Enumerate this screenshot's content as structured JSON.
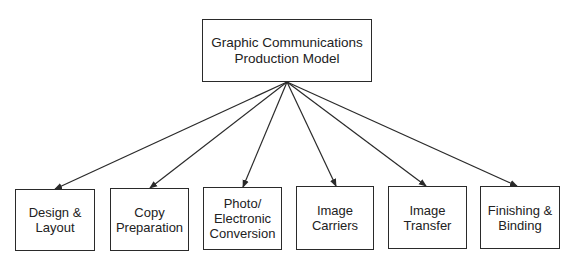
{
  "diagram": {
    "root": {
      "label": "Graphic Communications\nProduction Model",
      "box": {
        "x": 202,
        "y": 19,
        "w": 170,
        "h": 63
      }
    },
    "origin": {
      "x": 287,
      "y": 82
    },
    "children": [
      {
        "label": "Design &\nLayout",
        "box": {
          "x": 15,
          "y": 189,
          "w": 80,
          "h": 62
        },
        "arrow_end": {
          "x": 55,
          "y": 189
        }
      },
      {
        "label": "Copy\nPreparation",
        "box": {
          "x": 110,
          "y": 188,
          "w": 79,
          "h": 63
        },
        "arrow_end": {
          "x": 150,
          "y": 188
        }
      },
      {
        "label": "Photo/\nElectronic\nConversion",
        "box": {
          "x": 203,
          "y": 187,
          "w": 79,
          "h": 63
        },
        "arrow_end": {
          "x": 243,
          "y": 187
        }
      },
      {
        "label": "Image\nCarriers",
        "box": {
          "x": 296,
          "y": 186,
          "w": 78,
          "h": 64
        },
        "arrow_end": {
          "x": 336,
          "y": 186
        }
      },
      {
        "label": "Image\nTransfer",
        "box": {
          "x": 388,
          "y": 186,
          "w": 79,
          "h": 63
        },
        "arrow_end": {
          "x": 426,
          "y": 186
        }
      },
      {
        "label": "Finishing &\nBinding",
        "box": {
          "x": 480,
          "y": 186,
          "w": 80,
          "h": 63
        },
        "arrow_end": {
          "x": 517,
          "y": 186
        }
      }
    ],
    "colors": {
      "line": "#2a2a2a",
      "text": "#222222",
      "background": "#ffffff"
    }
  }
}
